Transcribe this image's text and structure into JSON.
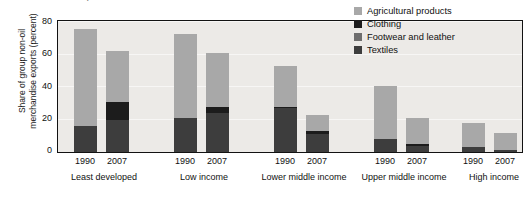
{
  "figure": {
    "cut_title": "merchandise exports",
    "ylabel": "Share of group non-oil\nmerchandise exports (percent)",
    "ylabel_line1": "Share of group non-oil",
    "ylabel_line2": "merchandise exports (percent)"
  },
  "colors": {
    "agricultural": "#a8a8a8",
    "clothing": "#1c1c1c",
    "footwear": "#6e6e6e",
    "textiles": "#3d3d3d",
    "plot_bg": "#eceae7",
    "frame": "#121212",
    "gridline": "#f7f6f5"
  },
  "legend": {
    "position": "top-right",
    "items": [
      {
        "label": "Agricultural products",
        "color": "#a8a8a8",
        "key": "agricultural"
      },
      {
        "label": "Clothing",
        "color": "#1c1c1c",
        "key": "clothing"
      },
      {
        "label": "Footwear and leather",
        "color": "#6e6e6e",
        "key": "footwear"
      },
      {
        "label": "Textiles",
        "color": "#3d3d3d",
        "key": "textiles"
      }
    ]
  },
  "yaxis": {
    "ticks": [
      "0",
      "20",
      "40",
      "60",
      "80"
    ],
    "min": 0,
    "max": 80
  },
  "groups": [
    {
      "name": "Least developed",
      "years": [
        "1990",
        "2007"
      ]
    },
    {
      "name": "Low income",
      "years": [
        "1990",
        "2007"
      ]
    },
    {
      "name": "Lower middle income",
      "years": [
        "1990",
        "2007"
      ]
    },
    {
      "name": "Upper middle income",
      "years": [
        "1990",
        "2007"
      ]
    },
    {
      "name": "High income",
      "years": [
        "1990",
        "2007"
      ]
    }
  ],
  "chart_data": {
    "type": "bar",
    "subtype": "stacked",
    "title": "",
    "xlabel": "",
    "ylabel": "Share of group non-oil merchandise exports (percent)",
    "ylim": [
      0,
      80
    ],
    "yticks": [
      0,
      20,
      40,
      60,
      80
    ],
    "grid": true,
    "legend_position": "top-right",
    "categories": [
      "Least developed 1990",
      "Least developed 2007",
      "Low income 1990",
      "Low income 2007",
      "Lower middle income 1990",
      "Lower middle income 2007",
      "Upper middle income 1990",
      "Upper middle income 2007",
      "High income 1990",
      "High income 2007"
    ],
    "group_names": [
      "Least developed",
      "Low income",
      "Lower middle income",
      "Upper middle income",
      "High income"
    ],
    "years": [
      "1990",
      "2007"
    ],
    "stack_order_bottom_to_top": [
      "Textiles",
      "Footwear and leather",
      "Clothing",
      "Agricultural products"
    ],
    "series": [
      {
        "name": "Textiles",
        "color": "#3d3d3d",
        "values": [
          16,
          20,
          21,
          24,
          27,
          11,
          8,
          4,
          3,
          1
        ]
      },
      {
        "name": "Footwear and leather",
        "color": "#6e6e6e",
        "values": [
          0,
          0,
          0,
          0,
          0,
          0,
          0,
          0,
          0,
          0
        ]
      },
      {
        "name": "Clothing",
        "color": "#1c1c1c",
        "values": [
          0,
          11,
          0,
          4,
          1,
          2,
          0,
          1,
          0,
          0
        ]
      },
      {
        "name": "Agricultural products",
        "color": "#a8a8a8",
        "values": [
          60,
          31,
          52,
          33,
          25,
          10,
          33,
          16,
          15,
          11
        ]
      }
    ],
    "totals": [
      76,
      62,
      73,
      61,
      53,
      23,
      41,
      21,
      18,
      12
    ]
  },
  "bar_layout": {
    "bars": [
      {
        "x": 16,
        "group": 0,
        "year": "1990",
        "segments": [
          {
            "k": "textiles",
            "v": 16
          },
          {
            "k": "clothing",
            "v": 0
          },
          {
            "k": "footwear",
            "v": 0
          },
          {
            "k": "agricultural",
            "v": 60
          }
        ]
      },
      {
        "x": 48,
        "group": 0,
        "year": "2007",
        "segments": [
          {
            "k": "textiles",
            "v": 20
          },
          {
            "k": "clothing",
            "v": 11
          },
          {
            "k": "footwear",
            "v": 0
          },
          {
            "k": "agricultural",
            "v": 31
          }
        ]
      },
      {
        "x": 116,
        "group": 1,
        "year": "1990",
        "segments": [
          {
            "k": "textiles",
            "v": 21
          },
          {
            "k": "clothing",
            "v": 0
          },
          {
            "k": "footwear",
            "v": 0
          },
          {
            "k": "agricultural",
            "v": 52
          }
        ]
      },
      {
        "x": 148,
        "group": 1,
        "year": "2007",
        "segments": [
          {
            "k": "textiles",
            "v": 24
          },
          {
            "k": "clothing",
            "v": 4
          },
          {
            "k": "footwear",
            "v": 0
          },
          {
            "k": "agricultural",
            "v": 33
          }
        ]
      },
      {
        "x": 216,
        "group": 2,
        "year": "1990",
        "segments": [
          {
            "k": "textiles",
            "v": 27
          },
          {
            "k": "clothing",
            "v": 1
          },
          {
            "k": "footwear",
            "v": 0
          },
          {
            "k": "agricultural",
            "v": 25
          }
        ]
      },
      {
        "x": 248,
        "group": 2,
        "year": "2007",
        "segments": [
          {
            "k": "textiles",
            "v": 11
          },
          {
            "k": "clothing",
            "v": 2
          },
          {
            "k": "footwear",
            "v": 0
          },
          {
            "k": "agricultural",
            "v": 10
          }
        ]
      },
      {
        "x": 316,
        "group": 3,
        "year": "1990",
        "segments": [
          {
            "k": "textiles",
            "v": 8
          },
          {
            "k": "clothing",
            "v": 0
          },
          {
            "k": "footwear",
            "v": 0
          },
          {
            "k": "agricultural",
            "v": 33
          }
        ]
      },
      {
        "x": 348,
        "group": 3,
        "year": "2007",
        "segments": [
          {
            "k": "textiles",
            "v": 4
          },
          {
            "k": "clothing",
            "v": 1
          },
          {
            "k": "footwear",
            "v": 0
          },
          {
            "k": "agricultural",
            "v": 16
          }
        ]
      },
      {
        "x": 404,
        "group": 4,
        "year": "1990",
        "segments": [
          {
            "k": "textiles",
            "v": 3
          },
          {
            "k": "clothing",
            "v": 0
          },
          {
            "k": "footwear",
            "v": 0
          },
          {
            "k": "agricultural",
            "v": 15
          }
        ]
      },
      {
        "x": 436,
        "group": 4,
        "year": "2007",
        "segments": [
          {
            "k": "textiles",
            "v": 1
          },
          {
            "k": "clothing",
            "v": 0
          },
          {
            "k": "footwear",
            "v": 0
          },
          {
            "k": "agricultural",
            "v": 11
          }
        ]
      }
    ],
    "group_label_centers": [
      104,
      204,
      304,
      404,
      494
    ],
    "year_label_centers": [
      85,
      117,
      185,
      217,
      285,
      317,
      385,
      417,
      473,
      505
    ],
    "plot": {
      "left": 57,
      "top": 20,
      "width": 466,
      "height": 133
    }
  }
}
